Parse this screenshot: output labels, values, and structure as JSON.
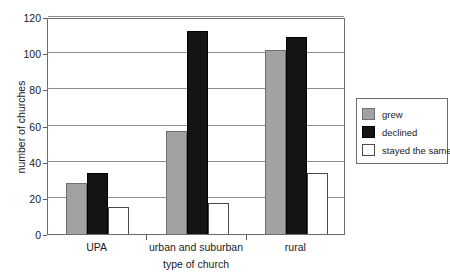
{
  "chart_data": {
    "type": "bar",
    "title": "",
    "xlabel": "type of church",
    "ylabel": "number of churches",
    "categories": [
      "UPA",
      "urban and suburban",
      "rural"
    ],
    "series": [
      {
        "name": "grew",
        "color": "#a2a2a2",
        "values": [
          28,
          57,
          102
        ]
      },
      {
        "name": "declined",
        "color": "#141414",
        "values": [
          34,
          112,
          109
        ]
      },
      {
        "name": "stayed the same",
        "color": "#ffffff",
        "values": [
          15,
          17,
          34
        ]
      }
    ],
    "ylim": [
      0,
      120
    ],
    "yticks": [
      0,
      20,
      40,
      60,
      80,
      100,
      120
    ],
    "ytick_labels": [
      "0",
      "20",
      "40",
      "60",
      "80",
      "100",
      "120"
    ],
    "grid": true,
    "legend_position": "right",
    "legend_entries": [
      "grew",
      "declined",
      "stayed the same"
    ]
  }
}
